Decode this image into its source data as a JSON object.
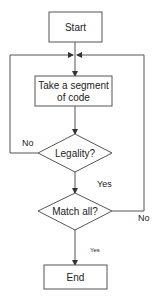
{
  "diagram": {
    "type": "flowchart",
    "colors": {
      "stroke": "#555555",
      "text": "#222222",
      "background": "#ffffff"
    },
    "nodes": {
      "start": {
        "label": "Start",
        "shape": "rectangle"
      },
      "take_segment": {
        "label_line1": "Take a segment",
        "label_line2": "of code",
        "shape": "rectangle"
      },
      "legality": {
        "label": "Legality?",
        "shape": "diamond"
      },
      "match_all": {
        "label": "Match all?",
        "shape": "diamond"
      },
      "end": {
        "label": "End",
        "shape": "rectangle"
      }
    },
    "edges": {
      "legality_no": {
        "label": "No",
        "from": "legality",
        "to": "take_segment"
      },
      "legality_yes": {
        "label": "Yes",
        "from": "legality",
        "to": "match_all"
      },
      "match_no": {
        "label": "No",
        "from": "match_all",
        "to": "take_segment"
      },
      "match_yes": {
        "label": "Yes",
        "from": "match_all",
        "to": "end"
      },
      "start_to_take": {
        "label": "",
        "from": "start",
        "to": "take_segment"
      }
    }
  }
}
